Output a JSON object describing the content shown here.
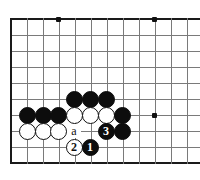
{
  "figure": {
    "caption": "",
    "board": {
      "left_edge_x": 11,
      "top_edge_y": 19,
      "bottom_edge_y": 163,
      "grid_spacing": 16,
      "columns": 12,
      "rows": 10,
      "grid_color": "#7a7a7a",
      "edge_color": "#1a1a1a",
      "background": "#ffffff",
      "cropped_right": true
    },
    "star_points": [
      {
        "name": "star-point-top-left",
        "x": 58,
        "y": 19
      },
      {
        "name": "star-point-top-right",
        "x": 154,
        "y": 19
      },
      {
        "name": "star-point-right",
        "x": 154,
        "y": 115
      }
    ],
    "stones": [
      {
        "id": "black-c4",
        "color": "black",
        "label": "",
        "x": 74,
        "y": 99
      },
      {
        "id": "black-d4",
        "color": "black",
        "label": "",
        "x": 90,
        "y": 99
      },
      {
        "id": "black-e4",
        "color": "black",
        "label": "",
        "x": 106,
        "y": 99
      },
      {
        "id": "black-a3",
        "color": "black",
        "label": "",
        "x": 27,
        "y": 115
      },
      {
        "id": "black-b3",
        "color": "black",
        "label": "",
        "x": 43,
        "y": 115
      },
      {
        "id": "black-c3",
        "color": "black",
        "label": "",
        "x": 58,
        "y": 115
      },
      {
        "id": "white-d3",
        "color": "white",
        "label": "",
        "x": 74,
        "y": 115
      },
      {
        "id": "white-e3",
        "color": "white",
        "label": "",
        "x": 90,
        "y": 115
      },
      {
        "id": "white-f3",
        "color": "white",
        "label": "",
        "x": 106,
        "y": 115
      },
      {
        "id": "black-g3",
        "color": "black",
        "label": "",
        "x": 122,
        "y": 115
      },
      {
        "id": "white-a2",
        "color": "white",
        "label": "",
        "x": 27,
        "y": 131
      },
      {
        "id": "white-b2",
        "color": "white",
        "label": "",
        "x": 43,
        "y": 131
      },
      {
        "id": "white-c2",
        "color": "white",
        "label": "",
        "x": 58,
        "y": 131
      },
      {
        "id": "black-move-3",
        "color": "black",
        "label": "3",
        "x": 106,
        "y": 131
      },
      {
        "id": "black-g2",
        "color": "black",
        "label": "",
        "x": 122,
        "y": 131
      },
      {
        "id": "white-move-2",
        "color": "white",
        "label": "2",
        "x": 74,
        "y": 147
      },
      {
        "id": "black-move-1",
        "color": "black",
        "label": "1",
        "x": 90,
        "y": 147
      }
    ],
    "point_labels": [
      {
        "id": "point-label-a",
        "label": "a",
        "x": 74,
        "y": 131
      }
    ],
    "move_sequence": [
      {
        "number": "1",
        "color": "black"
      },
      {
        "number": "2",
        "color": "white"
      },
      {
        "number": "3",
        "color": "black"
      }
    ]
  }
}
